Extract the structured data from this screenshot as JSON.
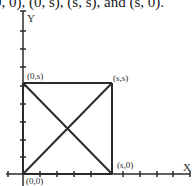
{
  "caption": {
    "text": "0, 0), (0, s), (s, s), and (s, 0)."
  },
  "diagram": {
    "axes": {
      "x_label": "X",
      "y_label": "Y"
    },
    "points": {
      "origin": "(0,0)",
      "top_left": "(0,s)",
      "top_right": "(s,s)",
      "bottom_right": "(s,0)"
    },
    "colors": {
      "line": "#2b2b2b",
      "text": "#2a2a2a",
      "background": "#ffffff"
    }
  }
}
